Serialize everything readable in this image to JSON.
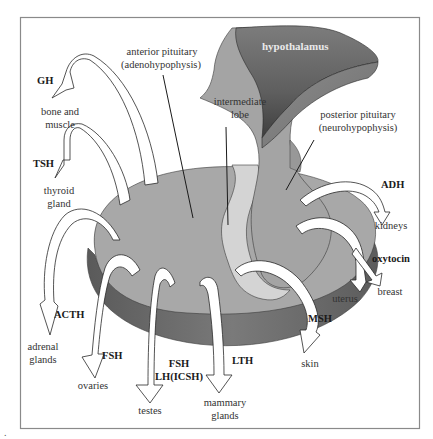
{
  "figure": {
    "corner_mark": ".",
    "colors": {
      "frame": "#8a8a8a",
      "disc_top": "#a6a6a6",
      "disc_side": "#6e6e6e",
      "hypothalamus": "#6a6a6a",
      "intermediate_lobe": "#d2d2d2",
      "arrow_fill": "#ffffff",
      "text": "#333333"
    }
  },
  "structures": {
    "hypothalamus": "hypothalamus",
    "anterior_pituitary": [
      "anterior pituitary",
      "(adenohypophysis)"
    ],
    "intermediate_lobe": [
      "intermediate",
      "lobe"
    ],
    "posterior_pituitary": [
      "posterior pituitary",
      "(neurohypophysis)"
    ]
  },
  "hormones": [
    {
      "id": "gh",
      "hormone": "GH",
      "target": [
        "bone and",
        "muscle"
      ],
      "source": "anterior"
    },
    {
      "id": "tsh",
      "hormone": "TSH",
      "target": [
        "thyroid",
        "gland"
      ],
      "source": "anterior"
    },
    {
      "id": "acth",
      "hormone": "ACTH",
      "target": [
        "adrenal",
        "glands"
      ],
      "source": "anterior"
    },
    {
      "id": "fsh-ovaries",
      "hormone": "FSH",
      "target": [
        "ovaries"
      ],
      "source": "anterior"
    },
    {
      "id": "fsh-lh-testes",
      "hormone": [
        "FSH",
        "LH(ICSH)"
      ],
      "target": [
        "testes"
      ],
      "source": "anterior"
    },
    {
      "id": "lth",
      "hormone": "LTH",
      "target": [
        "mammary",
        "glands"
      ],
      "source": "anterior"
    },
    {
      "id": "msh",
      "hormone": "MSH",
      "target": [
        "skin"
      ],
      "source": "intermediate"
    },
    {
      "id": "adh",
      "hormone": "ADH",
      "target": [
        "kidneys"
      ],
      "source": "posterior"
    },
    {
      "id": "oxytocin",
      "hormone": "oxytocin",
      "target": [
        "uterus",
        "breast"
      ],
      "source": "posterior"
    }
  ]
}
